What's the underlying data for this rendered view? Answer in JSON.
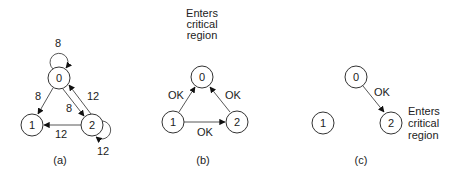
{
  "panels": [
    {
      "caption": "(a)",
      "nodes": [
        {
          "id": "0",
          "label": "0"
        },
        {
          "id": "1",
          "label": "1"
        },
        {
          "id": "2",
          "label": "2"
        }
      ],
      "edges": [
        {
          "from": "0",
          "to": "0",
          "label": "8"
        },
        {
          "from": "0",
          "to": "1",
          "label": "8"
        },
        {
          "from": "0",
          "to": "2",
          "label": "8"
        },
        {
          "from": "2",
          "to": "0",
          "label": "12"
        },
        {
          "from": "2",
          "to": "1",
          "label": "12"
        },
        {
          "from": "2",
          "to": "2",
          "label": "12"
        }
      ]
    },
    {
      "caption": "(b)",
      "note": [
        "Enters",
        "critical",
        "region"
      ],
      "nodes": [
        {
          "id": "0",
          "label": "0"
        },
        {
          "id": "1",
          "label": "1"
        },
        {
          "id": "2",
          "label": "2"
        }
      ],
      "edges": [
        {
          "from": "1",
          "to": "0",
          "label": "OK"
        },
        {
          "from": "2",
          "to": "0",
          "label": "OK"
        },
        {
          "from": "1",
          "to": "2",
          "label": "OK"
        }
      ]
    },
    {
      "caption": "(c)",
      "note": [
        "Enters",
        "critical",
        "region"
      ],
      "nodes": [
        {
          "id": "0",
          "label": "0"
        },
        {
          "id": "1",
          "label": "1"
        },
        {
          "id": "2",
          "label": "2"
        }
      ],
      "edges": [
        {
          "from": "0",
          "to": "2",
          "label": "OK"
        }
      ]
    }
  ]
}
